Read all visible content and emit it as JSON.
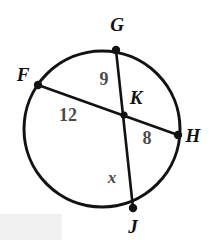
{
  "figure": {
    "kind": "circle-with-intersecting-chords",
    "background_color": "#ffffff",
    "stroke_color": "#121212",
    "point_label_color": "#121212",
    "segment_label_color": "#4a4a4a",
    "watermark_color": "#f0f0f1",
    "circle": {
      "center_x": 102,
      "center_y": 129,
      "radius": 78,
      "stroke_width": 3
    },
    "points": [
      {
        "name": "G",
        "label": "G",
        "x": 116,
        "y": 50,
        "label_x": 117,
        "label_y": 31
      },
      {
        "name": "F",
        "label": "F",
        "x": 38,
        "y": 85,
        "label_x": 23,
        "label_y": 81
      },
      {
        "name": "K",
        "label": "K",
        "x": 124,
        "y": 115,
        "label_x": 136,
        "label_y": 104
      },
      {
        "name": "H",
        "label": "H",
        "x": 178,
        "y": 135,
        "label_x": 193,
        "label_y": 142
      },
      {
        "name": "J",
        "label": "J",
        "x": 133,
        "y": 208,
        "label_x": 133,
        "label_y": 233
      }
    ],
    "chords": [
      {
        "name": "chord-GJ",
        "from": "G",
        "to": "J"
      },
      {
        "name": "chord-FH",
        "from": "F",
        "to": "H"
      }
    ],
    "segment_labels": [
      {
        "name": "segment-GK",
        "text": "9",
        "x": 104,
        "y": 85,
        "style": "number"
      },
      {
        "name": "segment-FK",
        "text": "12",
        "x": 68,
        "y": 121,
        "style": "number"
      },
      {
        "name": "segment-KH",
        "text": "8",
        "x": 147,
        "y": 144,
        "style": "number"
      },
      {
        "name": "segment-KJ",
        "text": "x",
        "x": 112,
        "y": 183,
        "style": "variable"
      }
    ]
  }
}
